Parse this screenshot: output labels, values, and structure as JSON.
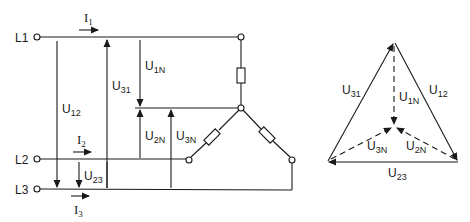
{
  "diagram": {
    "type": "three-phase star (wye) connection with voltage phasor diagram",
    "circuit": {
      "terminals": [
        {
          "id": "L1",
          "label": "L1"
        },
        {
          "id": "L2",
          "label": "L2"
        },
        {
          "id": "L3",
          "label": "L3"
        }
      ],
      "currents": [
        {
          "id": "I1",
          "base": "I",
          "sub": "1"
        },
        {
          "id": "I2",
          "base": "I",
          "sub": "2"
        },
        {
          "id": "I3",
          "base": "I",
          "sub": "3"
        }
      ],
      "line_voltages": [
        {
          "id": "U12",
          "base": "U",
          "sub": "12"
        },
        {
          "id": "U31",
          "base": "U",
          "sub": "31"
        },
        {
          "id": "U23",
          "base": "U",
          "sub": "23"
        }
      ],
      "phase_voltages": [
        {
          "id": "U1N",
          "base": "U",
          "sub": "1N"
        },
        {
          "id": "U2N",
          "base": "U",
          "sub": "2N"
        },
        {
          "id": "U3N",
          "base": "U",
          "sub": "3N"
        }
      ],
      "components": [
        "resistor-phase-1",
        "resistor-phase-2",
        "resistor-phase-3",
        "star-point-N"
      ]
    },
    "phasor": {
      "sides": [
        {
          "id": "U31",
          "base": "U",
          "sub": "31"
        },
        {
          "id": "U12",
          "base": "U",
          "sub": "12"
        },
        {
          "id": "U23",
          "base": "U",
          "sub": "23"
        }
      ],
      "star_vectors": [
        {
          "id": "U1N",
          "base": "U",
          "sub": "1N"
        },
        {
          "id": "U2N",
          "base": "U",
          "sub": "2N"
        },
        {
          "id": "U3N",
          "base": "U",
          "sub": "3N"
        }
      ]
    }
  }
}
